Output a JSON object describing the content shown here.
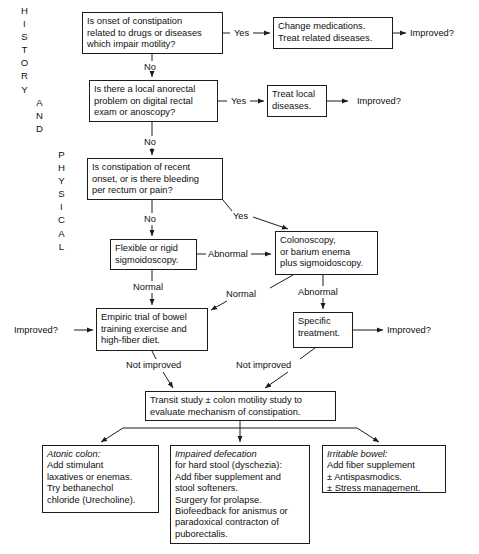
{
  "spine_labels": [
    {
      "id": "history",
      "letters": [
        "H",
        "I",
        "S",
        "T",
        "O",
        "R",
        "Y"
      ],
      "x": 18,
      "y": 4
    },
    {
      "id": "and",
      "letters": [
        "A",
        "N",
        "D"
      ],
      "x": 33,
      "y": 96
    },
    {
      "id": "physical",
      "letters": [
        "P",
        "H",
        "Y",
        "S",
        "I",
        "C",
        "A",
        "L"
      ],
      "x": 55,
      "y": 148
    }
  ],
  "boxes": {
    "drug_question": {
      "text": "Is onset of constipation\nrelated to drugs or diseases\nwhich impair motility?",
      "x": 82,
      "y": 12,
      "w": 141,
      "h": 42
    },
    "change_medications": {
      "text": "Change medications.\nTreat related diseases.",
      "x": 273,
      "y": 17,
      "w": 120,
      "h": 32
    },
    "anorectal_question": {
      "text": "Is there a local anorectal\nproblem on digital rectal\nexam or anoscopy?",
      "x": 89,
      "y": 80,
      "w": 129,
      "h": 42
    },
    "treat_local": {
      "text": "Treat local\ndiseases.",
      "x": 267,
      "y": 85,
      "w": 60,
      "h": 32
    },
    "recent_onset_question": {
      "text": "Is constipation of recent\nonset, or is there bleeding\nper rectum or pain?",
      "x": 87,
      "y": 158,
      "w": 136,
      "h": 42
    },
    "sigmoidoscopy": {
      "text": "Flexible or rigid\nsigmoidoscopy.",
      "x": 110,
      "y": 239,
      "w": 87,
      "h": 31
    },
    "colonoscopy": {
      "text": "Colonoscopy,\nor barium enema\nplus sigmoidoscopy.",
      "x": 275,
      "y": 231,
      "w": 103,
      "h": 44
    },
    "empiric_trial": {
      "text": "Empiric trial of bowel\ntraining exercise and\nhigh-fiber diet.",
      "x": 96,
      "y": 308,
      "w": 112,
      "h": 43
    },
    "specific_treatment": {
      "text": "Specific\ntreatment.",
      "x": 293,
      "y": 312,
      "w": 60,
      "h": 36
    },
    "transit_study": {
      "text": "Transit study ± colon motility study to\nevaluate mechanism of constipation.",
      "x": 145,
      "y": 391,
      "w": 191,
      "h": 30
    },
    "atonic_colon": {
      "title": "Atonic colon:",
      "text": "Add stimulant\nlaxatives or enemas.\nTry bethanechol\nchloride (Urecholine).",
      "x": 42,
      "y": 445,
      "w": 117,
      "h": 68
    },
    "impaired_defecation": {
      "title": "Impaired defecation",
      "text": "for hard stool (dyschezia):\nAdd fiber supplement and\nstool softeners.\nSurgery for prolapse.\nBiofeedback for anismus or\nparadoxical contracton of\npuborectalis.",
      "x": 170,
      "y": 445,
      "w": 140,
      "h": 99
    },
    "irritable_bowel": {
      "title": "Irritable bowel:",
      "text": "Add fiber supplement\n± Antispasmodics.\n± Stress management.",
      "x": 322,
      "y": 445,
      "w": 124,
      "h": 48
    }
  },
  "edge_labels": {
    "yes_drug": {
      "text": "Yes",
      "x": 234,
      "y": 28
    },
    "no_drug": {
      "text": "No",
      "x": 144,
      "y": 64
    },
    "yes_anorectal": {
      "text": "Yes",
      "x": 231,
      "y": 96
    },
    "no_anorectal": {
      "text": "No",
      "x": 144,
      "y": 139
    },
    "no_recent": {
      "text": "No",
      "x": 144,
      "y": 216
    },
    "yes_recent": {
      "text": "Yes",
      "x": 235,
      "y": 213
    },
    "abnormal_sigmoid": {
      "text": "Abnormal",
      "x": 210,
      "y": 250
    },
    "normal_sigmoid": {
      "text": "Normal",
      "x": 134,
      "y": 283
    },
    "normal_colon": {
      "text": "Normal",
      "x": 228,
      "y": 290
    },
    "abnormal_colon": {
      "text": "Abnormal",
      "x": 300,
      "y": 288
    },
    "not_improved_left": {
      "text": "Not improved",
      "x": 127,
      "y": 361
    },
    "not_improved_right": {
      "text": "Not improved",
      "x": 238,
      "y": 361
    }
  },
  "terminals": {
    "improved_drug": {
      "text": "Improved?",
      "x": 410,
      "y": 28
    },
    "improved_anorectal": {
      "text": "Improved?",
      "x": 358,
      "y": 96
    },
    "improved_empiric": {
      "text": "Improved?",
      "x": 14,
      "y": 325
    },
    "improved_specific": {
      "text": "Improved?",
      "x": 387,
      "y": 325
    }
  },
  "style": {
    "stroke": "#1c1c1c",
    "text": "#101010",
    "background": "#ffffff"
  }
}
